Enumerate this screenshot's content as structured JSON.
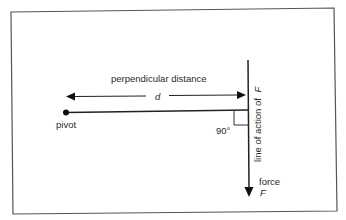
{
  "diagram": {
    "type": "physics-moment-diagram",
    "labels": {
      "perpendicular_distance": "perpendicular distance",
      "distance_symbol": "d",
      "pivot": "pivot",
      "right_angle": "90°",
      "line_of_action": "line of action of",
      "line_of_action_symbol": "F",
      "force": "force",
      "force_symbol": "F"
    },
    "colors": {
      "line": "#222222",
      "border": "#555555",
      "text": "#2a2a2a",
      "background": "#ffffff"
    },
    "geometry": {
      "frame": {
        "x1": 11,
        "y1": 11,
        "x2": 336,
        "y2": 213
      },
      "pivot_point": {
        "x": 66,
        "y": 112
      },
      "lever_end": {
        "x": 248,
        "y": 110
      },
      "force_line_top": {
        "x": 248,
        "y": 60
      },
      "force_arrow_tip": {
        "x": 249,
        "y": 197
      },
      "distance_arrow_y": 96,
      "right_angle_box": {
        "x": 234,
        "y": 110,
        "size": 14
      }
    }
  }
}
